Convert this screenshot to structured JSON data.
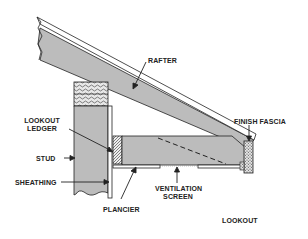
{
  "diagram": {
    "colors": {
      "wood_fill": "#bcbcbc",
      "outline": "#222222",
      "background": "#ffffff"
    },
    "labels": {
      "rafter": "RAFTER",
      "finish_fascia": "FINISH FASCIA",
      "lookout_ledger_line1": "LOOKOUT",
      "lookout_ledger_line2": "LEDGER",
      "stud": "STUD",
      "sheathing": "SHEATHING",
      "plancier": "PLANCIER",
      "ventilation_screen_line1": "VENTILATION",
      "ventilation_screen_line2": "SCREEN",
      "lookout": "LOOKOUT"
    }
  }
}
